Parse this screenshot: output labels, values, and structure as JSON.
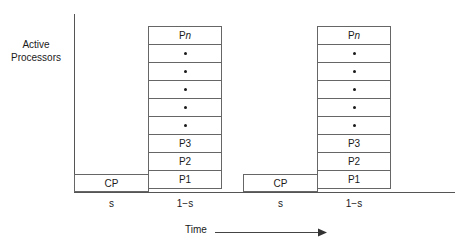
{
  "axes": {
    "y_label_lines": [
      "Active",
      "Processors"
    ],
    "time_label": "Time",
    "arrow_icon": "right-arrow-icon"
  },
  "stacks": [
    {
      "id": "stack-1",
      "cells": [
        {
          "type": "label",
          "prefix": "P",
          "suffix": "n"
        },
        {
          "type": "dot"
        },
        {
          "type": "dot"
        },
        {
          "type": "dot"
        },
        {
          "type": "dot"
        },
        {
          "type": "dot"
        },
        {
          "type": "label",
          "prefix": "P3",
          "suffix": ""
        },
        {
          "type": "label",
          "prefix": "P2",
          "suffix": ""
        },
        {
          "type": "label",
          "prefix": "P1",
          "suffix": ""
        }
      ]
    },
    {
      "id": "stack-2",
      "cells": [
        {
          "type": "label",
          "prefix": "P",
          "suffix": "n"
        },
        {
          "type": "dot"
        },
        {
          "type": "dot"
        },
        {
          "type": "dot"
        },
        {
          "type": "dot"
        },
        {
          "type": "dot"
        },
        {
          "type": "label",
          "prefix": "P3",
          "suffix": ""
        },
        {
          "type": "label",
          "prefix": "P2",
          "suffix": ""
        },
        {
          "type": "label",
          "prefix": "P1",
          "suffix": ""
        }
      ]
    }
  ],
  "serial_boxes": [
    {
      "label": "CP"
    },
    {
      "label": "CP"
    }
  ],
  "segment_labels": {
    "s1": "s",
    "minus_s1": "1−s",
    "s2": "s",
    "minus_s2": "1−s"
  },
  "colors": {
    "line": "#666666",
    "axis": "#555555",
    "text": "#1a1a1a",
    "background": "#ffffff"
  }
}
